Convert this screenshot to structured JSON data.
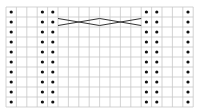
{
  "chart": {
    "cols": 18,
    "rows": 10,
    "origin": {
      "x": 6,
      "y": 7
    },
    "cell_w": 10.4,
    "cell_h": 10,
    "grid_color": "#c8c8c8",
    "dot_color": "#111111",
    "cable_color": "#333333",
    "purl_columns": [
      1,
      4,
      5,
      14,
      15,
      18
    ],
    "cables": [
      {
        "row": 2,
        "from_col": 6,
        "to_col": 9,
        "type": "4-stitch cross"
      },
      {
        "row": 2,
        "from_col": 10,
        "to_col": 13,
        "type": "4-stitch cross"
      }
    ],
    "legend": {
      "dot": "purl",
      "empty": "knit",
      "x-lines": "cable cross"
    }
  }
}
